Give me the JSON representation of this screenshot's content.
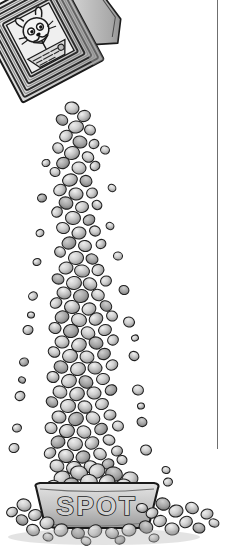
{
  "canvas": {
    "width": 232,
    "height": 547,
    "background": "#ffffff",
    "style": "grayscale pen-and-ink cartoon illustration"
  },
  "illustration": {
    "title": "Dog food box pouring kibble into a bowl",
    "subject": "cereal-style box tipped over, stream of kibble falling into a dog dish",
    "ink_color": "#1a1a1a",
    "fill_light": "#d9d9d9",
    "fill_mid": "#a8a8a8",
    "fill_dark": "#6f6f6f",
    "shadow_color": "#8a8a8a"
  },
  "box": {
    "name": "dog-food-box",
    "description": "tilted rectangular box with striped chevron border, open pouring flap at upper right",
    "label_text": "",
    "label_note": "scribbled illegible product text",
    "mascot": "cartoon dog face with round eyes and whiskers",
    "border_pattern": "nested diagonal stripes",
    "tilt_degrees": -28
  },
  "stream": {
    "name": "kibble-stream",
    "description": "cascading column of irregular kibble pellets from box mouth to bowl",
    "piece_count": 168,
    "scatter_count": 34
  },
  "bowl": {
    "name": "dog-bowl",
    "text": "SPOT",
    "text_style": "outlined block capitals",
    "description": "wide rounded dog dish heaped with kibble"
  },
  "ground": {
    "name": "spilled-kibble",
    "description": "loose kibble pellets scattered on the ground around the bowl"
  },
  "divider": {
    "name": "page-rule",
    "orientation": "vertical",
    "color": "#6f6f6f",
    "x": 217,
    "top": 0,
    "bottom": 449
  }
}
